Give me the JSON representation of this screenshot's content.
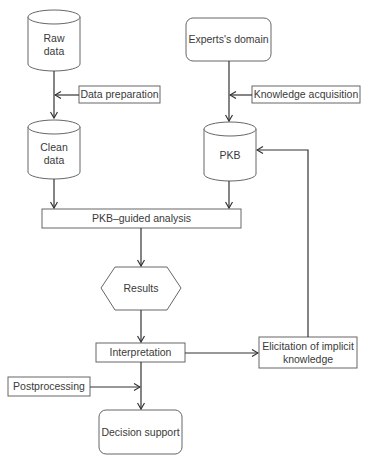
{
  "diagram": {
    "nodes": {
      "raw_data": {
        "label_line1": "Raw",
        "label_line2": "data",
        "shape": "cylinder"
      },
      "data_preparation": {
        "label": "Data preparation",
        "shape": "rectangle"
      },
      "clean_data": {
        "label_line1": "Clean",
        "label_line2": "data",
        "shape": "cylinder"
      },
      "experts_domain": {
        "label": "Experts's domain",
        "shape": "rounded-rectangle"
      },
      "knowledge_acquisition": {
        "label": "Knowledge acquisition",
        "shape": "rectangle"
      },
      "pkb": {
        "label": "PKB",
        "shape": "cylinder"
      },
      "pkb_guided_analysis": {
        "label": "PKB–guided analysis",
        "shape": "rectangle"
      },
      "results": {
        "label": "Results",
        "shape": "hexagon"
      },
      "interpretation": {
        "label": "Interpretation",
        "shape": "rectangle"
      },
      "elicitation": {
        "label_line1": "Elicitation of implicit",
        "label_line2": "knowledge",
        "shape": "rectangle"
      },
      "postprocessing": {
        "label": "Postprocessing",
        "shape": "rectangle"
      },
      "decision_support": {
        "label": "Decision support",
        "shape": "rounded-rectangle"
      }
    },
    "edges": [
      {
        "from": "raw_data",
        "to": "clean_data"
      },
      {
        "from": "data_preparation",
        "to": "raw_data->clean_data"
      },
      {
        "from": "experts_domain",
        "to": "pkb"
      },
      {
        "from": "knowledge_acquisition",
        "to": "experts_domain->pkb"
      },
      {
        "from": "clean_data",
        "to": "pkb_guided_analysis"
      },
      {
        "from": "pkb",
        "to": "pkb_guided_analysis"
      },
      {
        "from": "pkb_guided_analysis",
        "to": "results"
      },
      {
        "from": "results",
        "to": "interpretation"
      },
      {
        "from": "interpretation",
        "to": "elicitation"
      },
      {
        "from": "elicitation",
        "to": "pkb"
      },
      {
        "from": "interpretation",
        "to": "decision_support"
      },
      {
        "from": "postprocessing",
        "to": "interpretation->decision_support"
      }
    ],
    "colors": {
      "stroke": "#555555",
      "arrow": "#333333",
      "text": "#3a3a3a",
      "fill": "#ffffff"
    }
  }
}
